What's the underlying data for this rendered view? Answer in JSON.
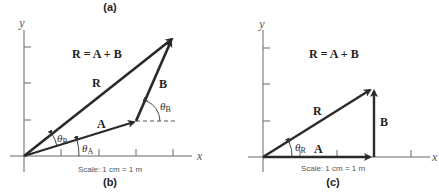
{
  "figure": {
    "panel_a_caption": "(a)",
    "panel_b": {
      "caption": "(b)",
      "equation": "R = A + B",
      "x_axis_label": "x",
      "y_axis_label": "y",
      "vector_labels": {
        "R": "R",
        "A": "A",
        "B": "B"
      },
      "angle_labels": {
        "theta_R": "θ",
        "theta_R_sub": "R",
        "theta_A": "θ",
        "theta_A_sub": "A",
        "theta_B": "θ",
        "theta_B_sub": "B"
      },
      "scale_text": "Scale: 1 cm = 1 m"
    },
    "panel_c": {
      "caption": "(c)",
      "equation": "R = A + B",
      "x_axis_label": "x",
      "y_axis_label": "y",
      "vector_labels": {
        "R": "R",
        "A": "A",
        "B": "B"
      },
      "angle_labels": {
        "theta_R": "θ",
        "theta_R_sub": "R"
      },
      "scale_text": "Scale: 1 cm = 1 m"
    },
    "colors": {
      "vector": "#2a2a2a",
      "axis": "#555555",
      "text": "#222222"
    }
  }
}
